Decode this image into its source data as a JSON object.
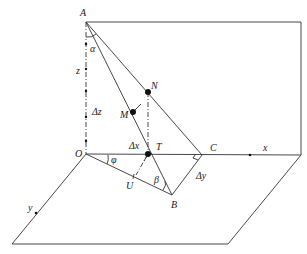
{
  "diagram": {
    "planes": {
      "vertical": "P",
      "horizontal": "Q"
    },
    "points": {
      "A": "A",
      "O": "O",
      "N": "N",
      "M": "M",
      "T": "T",
      "C": "C",
      "B": "B",
      "U": "U"
    },
    "axes": {
      "x": "x",
      "y": "y",
      "z": "z"
    },
    "angles": {
      "alpha": "α",
      "phi": "φ",
      "beta": "β"
    },
    "increments": {
      "dx": "Δx",
      "dy": "Δy",
      "dz": "Δz"
    }
  }
}
